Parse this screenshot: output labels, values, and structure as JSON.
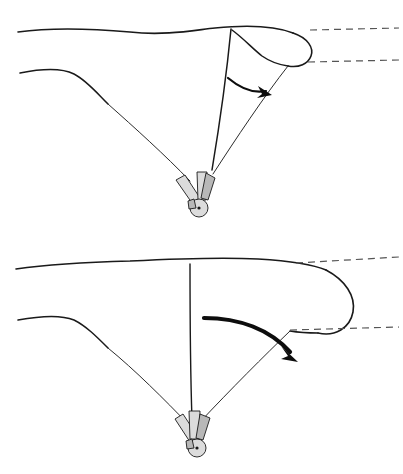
{
  "document": {
    "title": "Paraglider Wingtip Deflection Comparison",
    "type": "technical-line-diagram",
    "background_color": "#ffffff",
    "width": 403,
    "height": 474,
    "has_text_labels": false
  },
  "style": {
    "line_color": "#1a1a1a",
    "thin_line_color": "#2b2b2b",
    "dashed_line_color": "#555555",
    "arrow_color": "#0d0d0d",
    "harness_light_fill": "#dcdcdc",
    "harness_mid_fill": "#b8b8b8",
    "main_stroke_width": 1.6,
    "thin_stroke_width": 1.0,
    "dashed_stroke_width": 1.2,
    "dash_pattern": "7 5"
  },
  "panels": [
    {
      "id": "panel-top",
      "name": "small-wingtip-deflection",
      "arrow_weight": "thin",
      "arrow_description": "short curved arrow from centre line to right trailing line",
      "dashed_reference_lines": 2,
      "canopy_leading_edge": "M 18 32 C 55 27, 95 29, 130 32 C 165 36, 195 30, 215 28 C 245 25, 275 26, 293 33",
      "canopy_tip_outer": "M 293 33 C 308 38, 314 48, 311 56 C 308 64, 299 68, 288 66",
      "canopy_inner_fold": "M 232 30 C 243 38, 252 48, 262 56 C 272 63, 281 65, 288 66",
      "centre_rib": "M 231 29 C 228 60, 222 110, 212 170",
      "left_lower_surface": "M 20 73 C 45 68, 62 68, 74 74 C 86 80, 96 92, 108 104",
      "left_riser": "M 108 104 C 135 128, 165 155, 190 181",
      "right_riser": "M 288 66 C 265 95, 235 140, 213 174",
      "dash_upper": "M 310 30 L 399 28",
      "dash_lower": "M 308 62 L 399 60",
      "arrow_path": "M 228 78 C 240 88, 252 94, 266 91",
      "arrow_tip": [
        271,
        94
      ],
      "harness_center": [
        199,
        207
      ]
    },
    {
      "id": "panel-bottom",
      "name": "large-wingtip-deflection",
      "arrow_weight": "thick",
      "arrow_description": "long heavy curved arrow sweeping from centre line outward and down to the right trailing line",
      "dashed_reference_lines": 2,
      "canopy_leading_edge": "M 16 269 C 50 264, 90 262, 130 261 C 170 259, 220 257, 258 259 C 290 261, 312 264, 326 270",
      "canopy_tip_outer": "M 326 270 C 345 280, 356 296, 353 312 C 350 328, 335 337, 318 333",
      "canopy_inner_fold": "M 318 333 C 305 333, 296 332, 290 331",
      "centre_rib": "M 190 264 C 190 300, 190 360, 192 420",
      "left_lower_surface": "M 18 320 C 45 315, 62 315, 74 320 C 86 326, 96 336, 108 348",
      "left_riser": "M 108 348 C 135 370, 165 400, 188 424",
      "right_riser": "M 290 331 C 265 355, 230 390, 200 422",
      "dash_upper": "M 296 263 L 399 257",
      "dash_lower": "M 290 330 L 399 327",
      "arrow_path": "M 204 318 C 240 318, 270 330, 290 352",
      "arrow_tip": [
        296,
        359
      ],
      "harness_center": [
        197,
        447
      ]
    }
  ],
  "annotations": {
    "arrow_meaning": "direction of wingtip deflection",
    "dashed_line_meaning": "reference span lines",
    "harness_meaning": "pilot and harness at riser convergence"
  }
}
